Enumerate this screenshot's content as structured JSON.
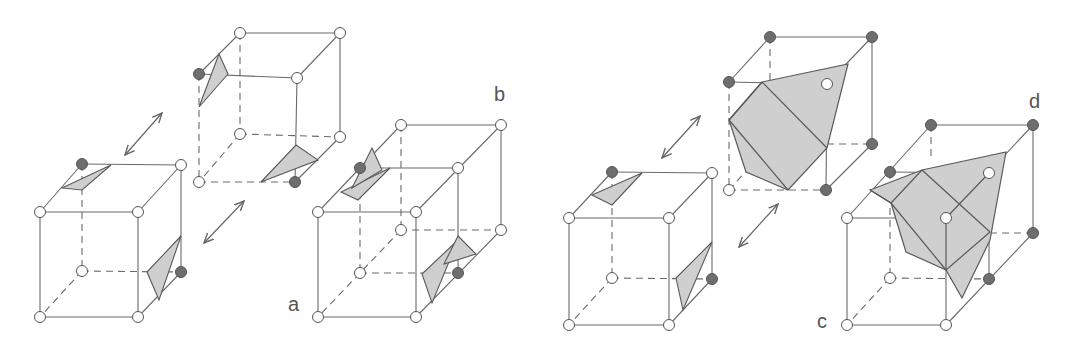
{
  "figure": {
    "colors": {
      "edge": "#6a6a6a",
      "surface_fill": "#cfcfcf",
      "surface_stroke": "#5a5a5a",
      "vertex_inside": "#6e6e6e",
      "vertex_outside": "#ffffff",
      "background": "#ffffff"
    },
    "labels": {
      "a": "a",
      "b": "b",
      "c": "c",
      "d": "d"
    },
    "panels": [
      {
        "id": "a",
        "label": "a",
        "desc": "Cube with two separated triangle patches on ambiguous face"
      },
      {
        "id": "b",
        "label": "b",
        "desc": "Adjacent cube pair showing hole between patches"
      },
      {
        "id": "c",
        "label": "c",
        "desc": "Cube with separated patches adjacent to complementary cube"
      },
      {
        "id": "d",
        "label": "d",
        "desc": "Adjacent cube pair with connected surface"
      }
    ],
    "arrows": [
      "double-arrow-upper-left",
      "double-arrow-lower-left",
      "double-arrow-upper-right",
      "double-arrow-lower-right"
    ]
  }
}
